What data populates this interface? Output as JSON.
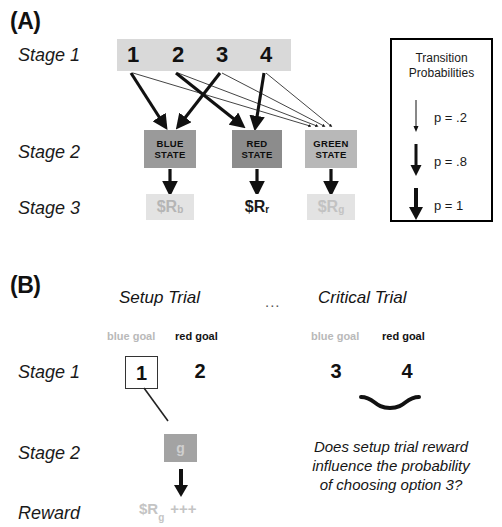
{
  "figure": {
    "panel_a_letter": "(A)",
    "panel_b_letter": "(B)"
  },
  "panel_a": {
    "row_labels": {
      "stage1": "Stage 1",
      "stage2": "Stage 2",
      "stage3": "Stage 3"
    },
    "stage1_options": [
      "1",
      "2",
      "3",
      "4"
    ],
    "stage2_states": [
      {
        "name": "blue-state",
        "line1": "BLUE",
        "line2": "STATE",
        "color": "#9a9a9a"
      },
      {
        "name": "red-state",
        "line1": "RED",
        "line2": "STATE",
        "color": "#8c8c8c"
      },
      {
        "name": "green-state",
        "line1": "GREEN",
        "line2": "STATE",
        "color": "#b8b8b8"
      }
    ],
    "stage3_rewards": [
      {
        "name": "reward-blue",
        "symbol": "$R",
        "subscript": "b",
        "emphasis": "faint"
      },
      {
        "name": "reward-red",
        "symbol": "$R",
        "subscript": "r",
        "emphasis": "strong"
      },
      {
        "name": "reward-green",
        "symbol": "$R",
        "subscript": "g",
        "emphasis": "faint"
      }
    ],
    "legend": {
      "title_line1": "Transition",
      "title_line2": "Probabilities",
      "entries": [
        {
          "name": "legend-thin-arrow",
          "label": "p = .2",
          "weight": "thin"
        },
        {
          "name": "legend-medium-arrow",
          "label": "p = .8",
          "weight": "medium"
        },
        {
          "name": "legend-thick-arrow",
          "label": "p = 1",
          "weight": "thick"
        }
      ]
    },
    "transitions": [
      {
        "from": "1",
        "to": "blue-state",
        "probability": ".8",
        "weight": "thick"
      },
      {
        "from": "1",
        "to": "green-state",
        "probability": ".2",
        "weight": "thin"
      },
      {
        "from": "2",
        "to": "red-state",
        "probability": ".8",
        "weight": "thick"
      },
      {
        "from": "2",
        "to": "green-state",
        "probability": ".2",
        "weight": "thin"
      },
      {
        "from": "3",
        "to": "blue-state",
        "probability": ".8",
        "weight": "thick"
      },
      {
        "from": "3",
        "to": "green-state",
        "probability": ".2",
        "weight": "thin"
      },
      {
        "from": "4",
        "to": "red-state",
        "probability": ".8",
        "weight": "thick"
      },
      {
        "from": "4",
        "to": "green-state",
        "probability": ".2",
        "weight": "thin"
      },
      {
        "from": "blue-state",
        "to": "reward-blue",
        "probability": "1",
        "weight": "thick"
      },
      {
        "from": "red-state",
        "to": "reward-red",
        "probability": "1",
        "weight": "thick"
      },
      {
        "from": "green-state",
        "to": "reward-green",
        "probability": "1",
        "weight": "thick"
      }
    ]
  },
  "panel_b": {
    "row_labels": {
      "stage1": "Stage 1",
      "stage2": "Stage 2",
      "reward": "Reward"
    },
    "setup_trial": {
      "title": "Setup Trial",
      "goal_blue": "blue goal",
      "goal_red": "red goal",
      "option_left": "1",
      "option_right": "2",
      "stage2_letter": "g",
      "reward_symbol": "$R",
      "reward_subscript": "g",
      "reward_plus": "+++"
    },
    "ellipsis": "...",
    "critical_trial": {
      "title": "Critical Trial",
      "goal_blue": "blue goal",
      "goal_red": "red goal",
      "option_left": "3",
      "option_right": "4",
      "question_line1": "Does setup trial reward",
      "question_line2": "influence the probability",
      "question_line3": "of choosing option 3?"
    }
  }
}
